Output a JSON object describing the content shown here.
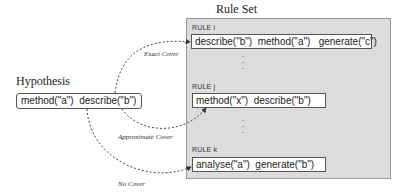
{
  "ruleset": {
    "title": "Rule Set",
    "rules": [
      {
        "label": "RULE i",
        "clause": "describe(\"b\")  method(\"a\")   generate(\"c\")"
      },
      {
        "label": "RULE j",
        "clause": "method(\"x\")  describe(\"b\")"
      },
      {
        "label": "RULE k",
        "clause": "analyse(\"a\")  generate(\"b\")"
      }
    ],
    "ellipsis": "⋮"
  },
  "hypothesis": {
    "title": "Hypothesis",
    "clause": "method(\"a\")  describe(\"b\")"
  },
  "edges": [
    {
      "label": "Exact Cover",
      "target": "RULE i"
    },
    {
      "label": "Approximate Cover",
      "target": "RULE j"
    },
    {
      "label": "No Cover",
      "target": "RULE k"
    }
  ],
  "colors": {
    "ruleset_bg": "#dcdcdc",
    "box_border": "#555555",
    "edge": "#333333"
  }
}
